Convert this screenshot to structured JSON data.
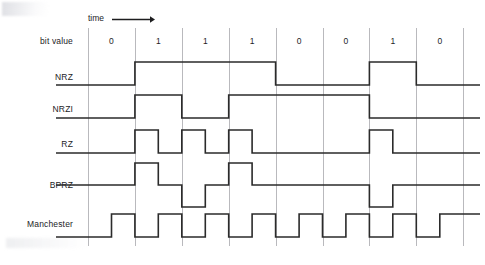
{
  "figure": {
    "time_axis_label": "time",
    "time_arrow_icon": "right-arrow-icon",
    "row_label_bit_value": "bit value",
    "caption": ""
  },
  "rows": [
    {
      "label": "NRZ"
    },
    {
      "label": "NRZI"
    },
    {
      "label": "RZ"
    },
    {
      "label": "BPRZ"
    },
    {
      "label": "Manchester"
    }
  ],
  "chart_data": {
    "type": "line",
    "xlabel": "time",
    "ylabel": "",
    "grid": true,
    "legend_position": "left-labels",
    "bit_values": [
      0,
      1,
      1,
      1,
      0,
      0,
      1,
      0
    ],
    "bit_labels": [
      "0",
      "1",
      "1",
      "1",
      "0",
      "0",
      "1",
      "0"
    ],
    "bit_cell_count": 8,
    "colors": {
      "line": "#2b2b2b",
      "grid": "#b9b9bd",
      "text": "#1d1d1f"
    },
    "series": [
      {
        "name": "NRZ",
        "description": "Non-return-to-zero: level held high for 1, low for 0 across the whole bit cell.",
        "levels": [
          "low",
          "high",
          "high",
          "high",
          "low",
          "low",
          "high",
          "low"
        ],
        "values": [
          0,
          1,
          1,
          1,
          0,
          0,
          1,
          0
        ],
        "ylim": [
          0,
          1
        ]
      },
      {
        "name": "NRZI",
        "description": "Non-return-to-zero inverted: level toggles at the start of every 1 bit, holds through 0 bits.",
        "levels": [
          "low",
          "high",
          "low",
          "high",
          "high",
          "high",
          "low",
          "low"
        ],
        "values": [
          0,
          1,
          0,
          1,
          1,
          1,
          0,
          0
        ],
        "ylim": [
          0,
          1
        ]
      },
      {
        "name": "RZ",
        "description": "Return-to-zero: a positive pulse occupies the first half of each 1 bit, then returns to zero.",
        "levels": [
          "zero",
          "pulse-positive",
          "pulse-positive",
          "pulse-positive",
          "zero",
          "zero",
          "pulse-positive",
          "zero"
        ],
        "values": [
          0,
          1,
          1,
          1,
          0,
          0,
          1,
          0
        ],
        "ylim": [
          0,
          1
        ]
      },
      {
        "name": "BPRZ",
        "description": "Bipolar return-to-zero: successive 1 bits alternate between positive and negative half-cell pulses; 0 bits stay at the zero line.",
        "levels": [
          "zero",
          "pulse-positive",
          "pulse-negative",
          "pulse-positive",
          "zero",
          "zero",
          "pulse-negative",
          "zero"
        ],
        "values": [
          0,
          1,
          -1,
          1,
          0,
          0,
          -1,
          0
        ],
        "ylim": [
          -1,
          1
        ]
      },
      {
        "name": "Manchester",
        "description": "Manchester encoding: every bit cell contains a mid-cell transition, low in the first half then high in the second half.",
        "levels": [
          "low-high",
          "low-high",
          "low-high",
          "low-high",
          "low-high",
          "low-high",
          "low-high",
          "low-high"
        ],
        "values": [
          0,
          1,
          1,
          1,
          0,
          0,
          1,
          0
        ],
        "ylim": [
          0,
          1
        ]
      }
    ]
  }
}
